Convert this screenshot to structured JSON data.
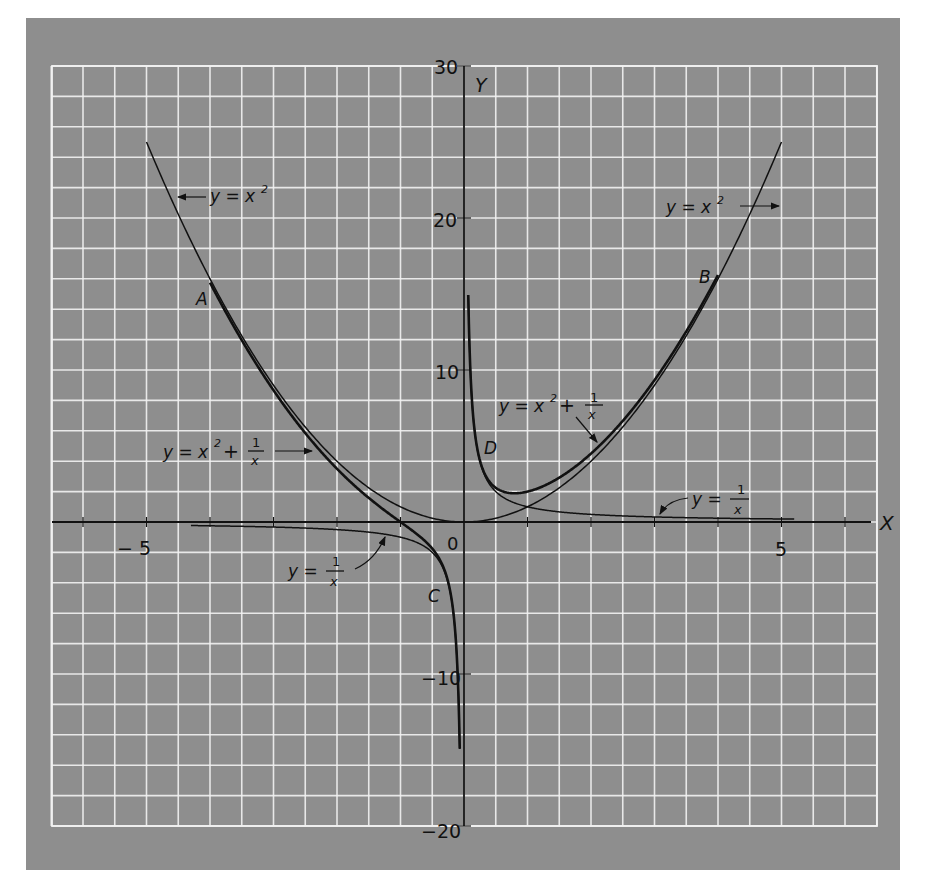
{
  "chart_data": {
    "type": "line",
    "title": "",
    "xlabel": "X",
    "ylabel": "Y",
    "xlim": [
      -6.5,
      6.5
    ],
    "ylim": [
      -20,
      30
    ],
    "grid": true,
    "grid_step": {
      "x": 0.5,
      "y": 2
    },
    "x_ticks": [
      -6,
      -5,
      -4,
      -3,
      -2,
      -1,
      1,
      2,
      3,
      4,
      5,
      6
    ],
    "x_tick_labels": [
      {
        "value": -5,
        "label": "− 5"
      },
      {
        "value": 5,
        "label": "5"
      }
    ],
    "y_tick_labels": [
      {
        "value": 30,
        "label": "30"
      },
      {
        "value": 20,
        "label": "20"
      },
      {
        "value": 10,
        "label": "10"
      },
      {
        "value": -10,
        "label": "−10"
      },
      {
        "value": -20,
        "label": "−20"
      }
    ],
    "origin_label": "0",
    "series": [
      {
        "name": "y = x²",
        "formula": "x^2",
        "x_range": [
          -5,
          5
        ],
        "style": "thin"
      },
      {
        "name": "y = 1/x",
        "formula": "1/x",
        "x_range_neg": [
          -4.3,
          -0.067
        ],
        "x_range_pos": [
          0.067,
          5.2
        ],
        "style": "thin"
      },
      {
        "name": "y = x² + 1/x",
        "formula": "x^2+1/x",
        "x_range_neg": [
          -4.0,
          -0.067
        ],
        "x_range_pos": [
          0.067,
          4.0
        ],
        "style": "thick"
      }
    ],
    "annotations": [
      {
        "text": "y = x²",
        "x": -3.9,
        "y": 22.5,
        "arrow_to": [
          -4.5,
          20.4
        ]
      },
      {
        "text": "y = x²",
        "x": 3.2,
        "y": 21.0,
        "arrow_to": [
          4.5,
          20.3
        ]
      },
      {
        "text": "y = x² + 1/x",
        "x": -4.5,
        "y": 4.8,
        "arrow_to": [
          -2.3,
          4.9
        ]
      },
      {
        "text": "y = x² + 1/x",
        "x": 0.55,
        "y": 7.8,
        "arrow_to": [
          2.0,
          4.5
        ]
      },
      {
        "text": "y = 1/x",
        "x": -2.7,
        "y": -3.8,
        "arrow_to": [
          -1.1,
          -0.9
        ]
      },
      {
        "text": "y = 1/x",
        "x": 3.2,
        "y": 1.9,
        "arrow_to": [
          2.6,
          0.4
        ]
      },
      {
        "text": "A",
        "x": -4.2,
        "y": 14.5
      },
      {
        "text": "B",
        "x": 3.7,
        "y": 16.7
      },
      {
        "text": "C",
        "x": -0.5,
        "y": -5.5
      },
      {
        "text": "D",
        "x": 0.3,
        "y": 5.0
      }
    ]
  },
  "labels": {
    "x_axis": "X",
    "y_axis": "Y",
    "origin": "0",
    "tick_neg5": "− 5",
    "tick_pos5": "5",
    "tick_30": "30",
    "tick_20": "20",
    "tick_10": "10",
    "tick_neg10": "−10",
    "tick_neg20": "−20",
    "point_a": "A",
    "point_b": "B",
    "point_c": "C",
    "point_d": "D",
    "eq_left_x2": "y = x",
    "eq_right_x2": "y = x",
    "eq_left_sum": "y = x",
    "eq_right_sum": "y = x",
    "sup2": "2",
    "plus": "+",
    "one": "1",
    "x_var": "x",
    "eq_left_inv": "y =",
    "eq_right_inv": "y ="
  },
  "colors": {
    "panel": "#8e8e8e",
    "grid": "#f2f2f2",
    "curve": "#111111"
  }
}
